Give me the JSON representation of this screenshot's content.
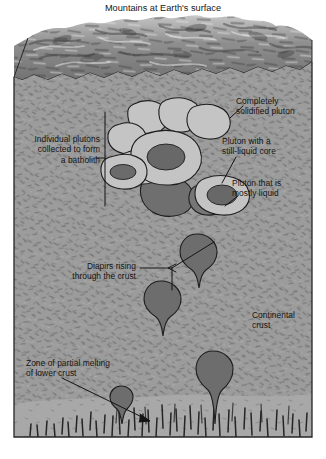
{
  "figure": {
    "title": "Mountains at Earth's surface",
    "type": "geologic-cross-section"
  },
  "labels": {
    "batholith": "Individual plutons\ncollected to form\na batholith",
    "solidified_pluton": "Completely\nsolidified pluton",
    "liquid_core_pluton": "Pluton with a\nstill-liquid core",
    "mostly_liquid_pluton": "Pluton that is\nmostly liquid",
    "diapirs": "Diapirs rising\nthrough the crust",
    "continental_crust": "Continental\ncrust",
    "partial_melting": "Zone of partial melting\nof lower crust"
  },
  "colors": {
    "background": "#ffffff",
    "crust_fill": "#9c9c9c",
    "crust_speckle": "#6e6e6e",
    "pluton_solid_fill": "#c2c2c2",
    "pluton_core_fill": "#6a6a6a",
    "pluton_liquid_fill": "#757575",
    "diapir_fill": "#6d6d6d",
    "melt_zone_fill": "#b0b0b0",
    "melt_tick": "#2b2b2b",
    "outline": "#1e1e1e",
    "leader_line": "#141414",
    "mountain_light": "#d8d8d8",
    "mountain_dark": "#4a4a4a",
    "frame_border": "#262626"
  },
  "features": {
    "mountain_block_label": "mountain topography block",
    "block_top_y": 20,
    "surface_y": 70,
    "block_bottom_y": 437,
    "melt_zone_top_y": 396,
    "plutons_solid_count": 5,
    "plutons_cored_count": 2,
    "plutons_liquid_count": 2,
    "diapir_count": 3
  }
}
